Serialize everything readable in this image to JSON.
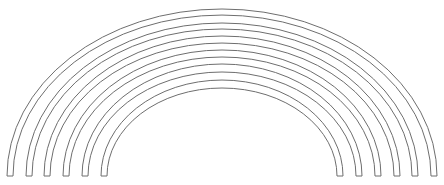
{
  "diagram": {
    "stroke_color": "#6e6e6e",
    "fill_color": "#ffffff",
    "background": "#ffffff",
    "center_x": 222,
    "baseline_y": 176,
    "bands": [
      {
        "outer_x": 7,
        "inner_x": 13,
        "outer_top": 9,
        "inner_top": 15
      },
      {
        "outer_x": 26,
        "inner_x": 32,
        "outer_top": 23,
        "inner_top": 29
      },
      {
        "outer_x": 44,
        "inner_x": 50,
        "outer_top": 36,
        "inner_top": 43
      },
      {
        "outer_x": 63,
        "inner_x": 69,
        "outer_top": 50,
        "inner_top": 57
      },
      {
        "outer_x": 82,
        "inner_x": 88,
        "outer_top": 64,
        "inner_top": 72
      },
      {
        "outer_x": 101,
        "inner_x": 107,
        "outer_top": 80,
        "inner_top": 88
      }
    ]
  }
}
